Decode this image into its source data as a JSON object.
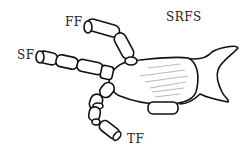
{
  "diagram": {
    "title": "SRFS",
    "labels": {
      "ff": "FF",
      "sf": "SF",
      "tf": "TF"
    },
    "colors": {
      "stroke": "#111111",
      "fill": "#ffffff",
      "hatch": "#888888"
    }
  }
}
